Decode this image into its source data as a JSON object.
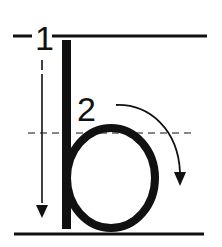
{
  "diagram": {
    "letter": "b",
    "steps": [
      {
        "number": "1",
        "description": "straight line down"
      },
      {
        "number": "2",
        "description": "curve around clockwise"
      }
    ],
    "guidelines": [
      "top-line",
      "dashed-midline",
      "baseline"
    ],
    "colors": {
      "ink": "#111111",
      "background": "#ffffff"
    }
  }
}
